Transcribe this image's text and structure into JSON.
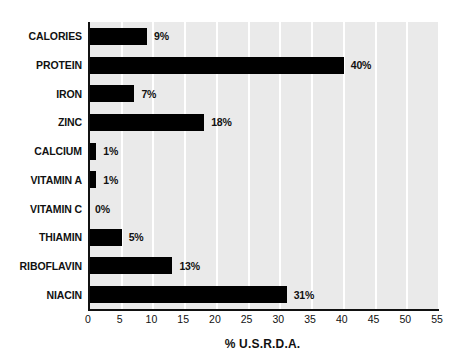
{
  "chart_data": {
    "type": "bar",
    "orientation": "horizontal",
    "title": "",
    "xlabel": "% U.S.R.D.A.",
    "ylabel": "",
    "categories": [
      "CALORIES",
      "PROTEIN",
      "IRON",
      "ZINC",
      "CALCIUM",
      "VITAMIN A",
      "VITAMIN C",
      "THIAMIN",
      "RIBOFLAVIN",
      "NIACIN"
    ],
    "values": [
      9,
      40,
      7,
      18,
      1,
      1,
      0,
      5,
      13,
      31
    ],
    "data_labels": [
      "9%",
      "40%",
      "7%",
      "18%",
      "1%",
      "1%",
      "0%",
      "5%",
      "13%",
      "31%"
    ],
    "xlim": [
      0,
      55
    ],
    "xticks": [
      0,
      5,
      10,
      15,
      20,
      25,
      30,
      35,
      40,
      45,
      50,
      55
    ],
    "xtick_labels": [
      "0",
      "5",
      "10",
      "15",
      "20",
      "25",
      "30",
      "35",
      "40",
      "45",
      "50",
      "55"
    ],
    "grid": "vertical",
    "legend": "none",
    "colors": {
      "bar": "#000000",
      "plot_background": "#eaeaea",
      "gridline": "#ffffff",
      "axis": "#111111",
      "text": "#111111",
      "page_background": "#ffffff"
    }
  }
}
